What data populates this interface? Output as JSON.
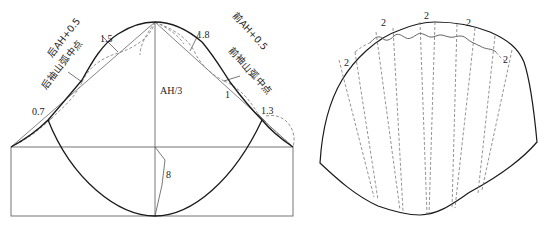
{
  "colors": {
    "outline": "#1a1a1a",
    "construction": "#555555",
    "dashed": "#777777",
    "text": "#222222",
    "background": "#ffffff"
  },
  "left_diagram": {
    "title": "sleeve cap construction",
    "labels": {
      "back_ah": "后AH+0.5",
      "back_cap_mid": "后袖山弧中点",
      "front_ah": "前AH+0.5",
      "front_cap_mid": "前袖山弧中点",
      "cap_height": "AH/3",
      "m_1_5": "1.5",
      "m_1_8": "1.8",
      "m_0_7": "0.7",
      "m_1": "1",
      "m_1_3": "1.3",
      "m_8": "8"
    }
  },
  "right_diagram": {
    "title": "sleeve slash-and-spread pattern",
    "labels": {
      "spread_1": "2",
      "spread_2": "2",
      "spread_3": "2",
      "spread_4": "2",
      "spread_5": "2"
    }
  }
}
